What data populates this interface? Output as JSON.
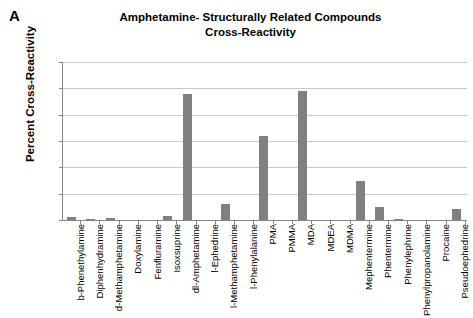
{
  "panel": {
    "letter": "A"
  },
  "chart_data": {
    "type": "bar",
    "title": "Amphetamine- Structurally Related Compounds Cross-Reactivity",
    "title_line1": "Amphetamine- Structurally Related Compounds",
    "title_line2": "Cross-Reactivity",
    "xlabel": "",
    "ylabel": "Percent Cross-Reactivity",
    "ylim": [
      0,
      60
    ],
    "yticks": [
      0,
      10,
      20,
      30,
      40,
      50,
      60
    ],
    "ytick_labels": [
      "0",
      "10",
      "20",
      "30",
      "40",
      "50",
      "60"
    ],
    "grid": true,
    "legend": "none",
    "bar_color": "#808080",
    "categories": [
      "b-Phenethylamine",
      "Diphenhydramine",
      "d-Methamphetamine",
      "Doxylamine",
      "Fenfluramine",
      "Isoxsuprine",
      "dl-Amphetamine",
      "l-Ephedrine",
      "l-Methamphetamine",
      "l-Phenylalanine",
      "PMA",
      "PMMA",
      "MDA",
      "MDEA",
      "MDMA",
      "Mephentermine",
      "Phentermine",
      "Phenylephrine",
      "Phenylpropanolamine",
      "Procaine",
      "Pseudoephedrine"
    ],
    "values": [
      1,
      0.3,
      0.8,
      0,
      0,
      1.6,
      48,
      0,
      6,
      0,
      32,
      0,
      49,
      0,
      0,
      15,
      5,
      0.5,
      0,
      0,
      4
    ]
  },
  "colors": {
    "bar": "#808080",
    "grid": "#c9c9c9",
    "axis": "#868686",
    "text": "#000000"
  }
}
